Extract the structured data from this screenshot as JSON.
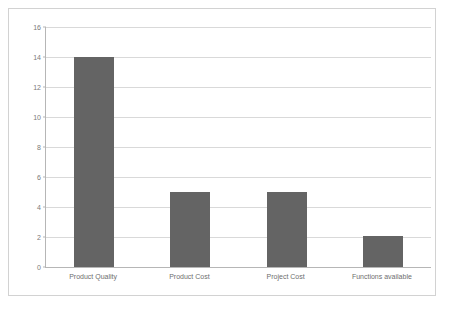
{
  "chart_data": {
    "type": "bar",
    "title": "",
    "subtitle": "",
    "xlabel": "",
    "ylabel": "",
    "categories": [
      "Product Quality",
      "Product Cost",
      "Project Cost",
      "Functions available"
    ],
    "values": [
      14,
      5,
      5,
      2.1
    ],
    "ylim": [
      0,
      16
    ],
    "ytick_step": 2,
    "yticks": [
      16,
      14,
      12,
      10,
      8,
      6,
      4,
      2,
      0
    ],
    "ytick_labels": [
      "16",
      "14",
      "12",
      "10",
      "8",
      "6",
      "4",
      "2",
      "0"
    ],
    "grid": "horizontal",
    "legend": "none",
    "series": [
      {
        "name": "",
        "values": [
          14,
          5,
          5,
          2.1
        ]
      }
    ],
    "colors": {
      "bar": "#646464",
      "gridline": "#d9d9d9",
      "axis": "#b6b6b6",
      "plot_background": "#ffffff",
      "frame_border": "#d2d2d2",
      "tick_text": "#7a7a7a",
      "category_text": "#6e6e6e"
    }
  }
}
